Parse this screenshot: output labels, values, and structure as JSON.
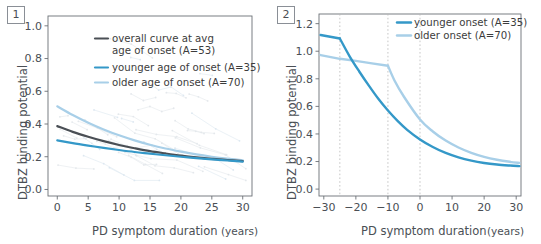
{
  "figure": {
    "background": "#ffffff",
    "colors": {
      "overall": "#4a4f55",
      "younger": "#3498c8",
      "older": "#a8cfe8",
      "spaghetti": "#cfd6dd",
      "axis": "#6b7076",
      "grid_dashed": "#b9b9b9"
    }
  },
  "panel1": {
    "badge": "1",
    "legend": [
      {
        "label_line1": "overall curve at avg",
        "label_line2": "age of onset (A=53)",
        "color": "#4a4f55",
        "name": "overall"
      },
      {
        "label_line1": "younger age of onset (A=35)",
        "label_line2": "",
        "color": "#3498c8",
        "name": "younger"
      },
      {
        "label_line1": "older age of onset (A=70)",
        "label_line2": "",
        "color": "#a8cfe8",
        "name": "older"
      }
    ],
    "chart_data": {
      "type": "line",
      "title": "",
      "xlabel": "PD symptom duration",
      "xunits": "(years)",
      "ylabel": "DTBZ binding potential",
      "xlim": [
        -1.5,
        31.5
      ],
      "ylim": [
        -0.04,
        1.06
      ],
      "xticks": [
        0,
        5,
        10,
        15,
        20,
        25,
        30
      ],
      "xticklabels": [
        "0",
        "5",
        "10",
        "15",
        "20",
        "25",
        "30"
      ],
      "yticks": [
        0.0,
        0.2,
        0.4,
        0.6,
        0.8,
        1.0
      ],
      "yticklabels": [
        "0.0",
        "0.2",
        "0.4",
        "0.6",
        "0.8",
        "1.0"
      ],
      "grid": false,
      "legend_position": "upper-center",
      "series": [
        {
          "name": "overall curve at avg age of onset (A=53)",
          "color": "#4a4f55",
          "x": [
            0,
            2.5,
            5,
            7.5,
            10,
            12.5,
            15,
            17.5,
            20,
            22.5,
            25,
            27.5,
            30
          ],
          "values": [
            0.387,
            0.352,
            0.322,
            0.295,
            0.272,
            0.252,
            0.234,
            0.22,
            0.207,
            0.196,
            0.187,
            0.18,
            0.173
          ]
        },
        {
          "name": "younger age of onset (A=35)",
          "color": "#3498c8",
          "x": [
            0,
            2.5,
            5,
            7.5,
            10,
            12.5,
            15,
            17.5,
            20,
            22.5,
            25,
            27.5,
            30
          ],
          "values": [
            0.3,
            0.283,
            0.268,
            0.254,
            0.241,
            0.229,
            0.219,
            0.209,
            0.2,
            0.192,
            0.184,
            0.177,
            0.17
          ]
        },
        {
          "name": "older age of onset (A=70)",
          "color": "#a8cfe8",
          "x": [
            0,
            2.5,
            5,
            7.5,
            10,
            12.5,
            15,
            17.5,
            20,
            22.5,
            25,
            27.5,
            30
          ],
          "values": [
            0.508,
            0.455,
            0.408,
            0.367,
            0.331,
            0.3,
            0.273,
            0.25,
            0.231,
            0.214,
            0.2,
            0.188,
            0.178
          ]
        }
      ],
      "subject_trajectories_note": "faint grey individual subject lines with point markers"
    }
  },
  "panel2": {
    "badge": "2",
    "legend": [
      {
        "label": "younger onset (A=35)",
        "color": "#3498c8",
        "name": "younger"
      },
      {
        "label": "older onset (A=70)",
        "color": "#a8cfe8",
        "name": "older"
      }
    ],
    "chart_data": {
      "type": "line",
      "title": "",
      "xlabel": "PD symptom duration",
      "xunits": "(years)",
      "ylabel": "DTBZ binding potential",
      "xlim": [
        -31.5,
        31.5
      ],
      "ylim": [
        -0.05,
        1.27
      ],
      "xticks": [
        -30,
        -20,
        -10,
        0,
        10,
        20,
        30
      ],
      "xticklabels": [
        "−30",
        "−20",
        "−10",
        "0",
        "10",
        "20",
        "30"
      ],
      "yticks": [
        0.0,
        0.2,
        0.4,
        0.6,
        0.8,
        1.0,
        1.2
      ],
      "yticklabels": [
        "0.0",
        "0.2",
        "0.4",
        "0.6",
        "0.8",
        "1.0",
        "1.2"
      ],
      "grid": false,
      "vertical_dashed_lines": [
        -25,
        -10,
        0
      ],
      "legend_position": "upper-right",
      "series": [
        {
          "name": "younger onset (A=35)",
          "color": "#3498c8",
          "breakpoint": -25,
          "x": [
            -31,
            -28,
            -25,
            -22,
            -19,
            -16,
            -13,
            -10,
            -7,
            -4,
            0,
            4,
            8,
            12,
            16,
            20,
            24,
            28,
            31
          ],
          "values": [
            1.118,
            1.105,
            1.092,
            0.965,
            0.855,
            0.752,
            0.655,
            0.57,
            0.495,
            0.43,
            0.36,
            0.305,
            0.262,
            0.23,
            0.206,
            0.189,
            0.178,
            0.171,
            0.167
          ]
        },
        {
          "name": "older onset (A=70)",
          "color": "#a8cfe8",
          "breakpoint": -10,
          "x": [
            -31,
            -25,
            -20,
            -15,
            -10,
            -8,
            -5,
            0,
            4,
            8,
            12,
            16,
            20,
            24,
            28,
            31
          ],
          "values": [
            0.972,
            0.945,
            0.93,
            0.912,
            0.895,
            0.79,
            0.67,
            0.505,
            0.418,
            0.352,
            0.302,
            0.263,
            0.234,
            0.213,
            0.198,
            0.19
          ]
        }
      ]
    }
  }
}
